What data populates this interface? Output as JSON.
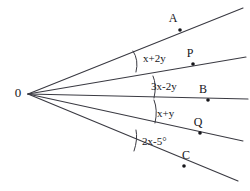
{
  "figure": {
    "type": "geometry-diagram",
    "background_color": "#ffffff",
    "stroke_color": "#3a3a42",
    "text_color": "#16161a"
  },
  "vertex": {
    "label": "0",
    "x": 18,
    "y": 97
  },
  "rays": [
    {
      "id": "ray-a",
      "endpoint_label": "A",
      "from": [
        28,
        94
      ],
      "to": [
        243,
        8
      ],
      "label_pos": [
        173,
        22
      ],
      "dot": [
        180,
        30
      ]
    },
    {
      "id": "ray-p",
      "endpoint_label": "P",
      "from": [
        28,
        94
      ],
      "to": [
        246,
        57
      ],
      "label_pos": [
        190,
        57
      ],
      "dot": [
        193,
        64
      ]
    },
    {
      "id": "ray-b",
      "endpoint_label": "B",
      "from": [
        28,
        94
      ],
      "to": [
        248,
        99
      ],
      "label_pos": [
        203,
        93
      ],
      "dot": [
        208,
        100
      ]
    },
    {
      "id": "ray-q",
      "endpoint_label": "Q",
      "from": [
        28,
        94
      ],
      "to": [
        243,
        141
      ],
      "label_pos": [
        198,
        126
      ],
      "dot": [
        200,
        133
      ]
    },
    {
      "id": "ray-c",
      "endpoint_label": "C",
      "from": [
        28,
        94
      ],
      "to": [
        238,
        181
      ],
      "label_pos": [
        186,
        159
      ],
      "dot": [
        184,
        166
      ]
    }
  ],
  "angles": [
    {
      "id": "angle-aop",
      "label": "x+2y",
      "label_pos": [
        143,
        62
      ],
      "arc": "M 133,51 Q 139,60 136,72"
    },
    {
      "id": "angle-pob",
      "label": "3x-2y",
      "label_pos": [
        151,
        90
      ],
      "arc": "M 153,76 Q 157,85 154,98"
    },
    {
      "id": "angle-boq",
      "label": "x+y",
      "label_pos": [
        157,
        117
      ],
      "arc": "M 154,100 Q 158,110 155,123"
    },
    {
      "id": "angle-qoc",
      "label": "2x-5°",
      "label_pos": [
        142,
        145
      ],
      "arc": "M 136,130 Q 138,139 134,151"
    }
  ]
}
